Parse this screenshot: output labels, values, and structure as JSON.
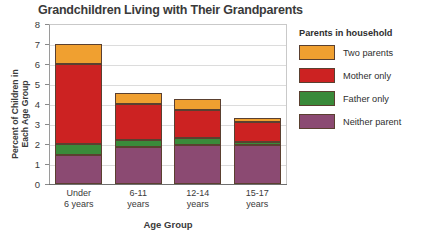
{
  "chart_data": {
    "type": "bar",
    "subtype": "stacked-bar",
    "title": "Grandchildren Living with Their Grandparents",
    "xlabel": "Age Group",
    "ylabel": "Percent of Children in Each Age Group",
    "ylabel_line1": "Percent of Children in",
    "ylabel_line2": "Each Age Group",
    "ylim": [
      0,
      8
    ],
    "yticks": [
      "0",
      "1",
      "2",
      "3",
      "4",
      "5",
      "6",
      "7",
      "8"
    ],
    "grid": "horizontal",
    "legend_position": "right",
    "legend_title": "Parents in household",
    "categories": [
      "Under 6 years",
      "6-11 years",
      "12-14 years",
      "15-17 years"
    ],
    "categories_wrapped": [
      {
        "line1": "Under",
        "line2": "6 years"
      },
      {
        "line1": "6-11",
        "line2": "years"
      },
      {
        "line1": "12-14",
        "line2": "years"
      },
      {
        "line1": "15-17",
        "line2": "years"
      }
    ],
    "series": [
      {
        "name": "Neither parent",
        "color": "#8B4A72",
        "values": [
          1.45,
          1.85,
          1.95,
          1.95
        ]
      },
      {
        "name": "Father only",
        "color": "#3A8A3A",
        "values": [
          0.55,
          0.35,
          0.35,
          0.15
        ]
      },
      {
        "name": "Mother only",
        "color": "#CC2222",
        "values": [
          4.0,
          1.8,
          1.4,
          1.0
        ]
      },
      {
        "name": "Two parents",
        "color": "#F0A030",
        "values": [
          1.0,
          0.55,
          0.55,
          0.2
        ]
      }
    ],
    "totals": [
      7.0,
      4.55,
      4.25,
      3.3
    ],
    "stack_order_bottom_to_top": [
      "Neither parent",
      "Father only",
      "Mother only",
      "Two parents"
    ]
  }
}
